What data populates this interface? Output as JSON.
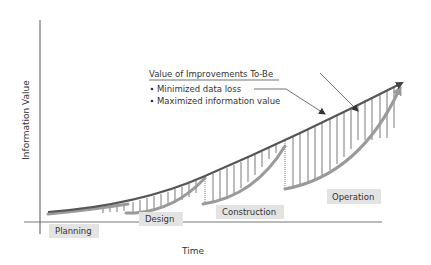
{
  "diagram": {
    "type": "information-value-lifecycle",
    "y_axis_label": "Information Value",
    "x_axis_label": "Time",
    "callout": {
      "title": "Value of Improvements To-Be",
      "bullets": [
        "Minimized data loss",
        "Maximized information value"
      ]
    },
    "phases": [
      {
        "label": "Planning"
      },
      {
        "label": "Design"
      },
      {
        "label": "Construction"
      },
      {
        "label": "Operation"
      }
    ],
    "colors": {
      "axis": "#555555",
      "top_line": "#555555",
      "phase_curve": "#9a9a9a",
      "hatch": "#444444",
      "label_box": "#e3e3e3",
      "text": "#333333"
    }
  }
}
